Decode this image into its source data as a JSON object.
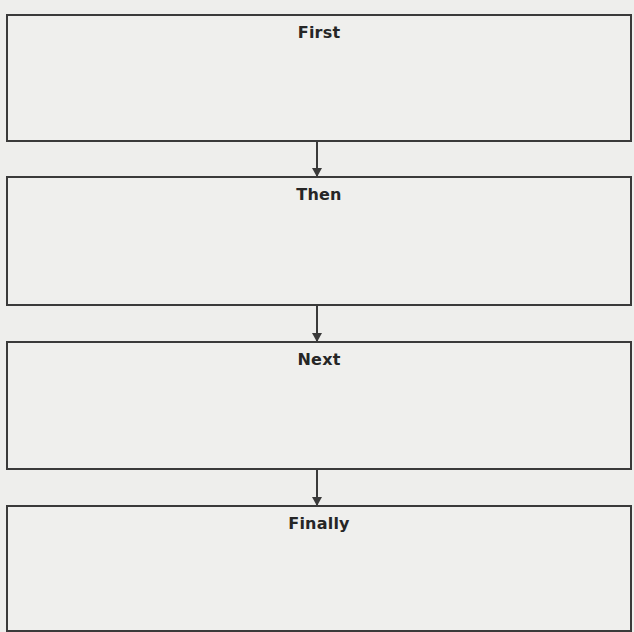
{
  "flowchart": {
    "steps": [
      {
        "label": "First"
      },
      {
        "label": "Then"
      },
      {
        "label": "Next"
      },
      {
        "label": "Finally"
      }
    ],
    "colors": {
      "border": "#3a3a3a",
      "text": "#262626",
      "background": "#eeeeec"
    }
  }
}
